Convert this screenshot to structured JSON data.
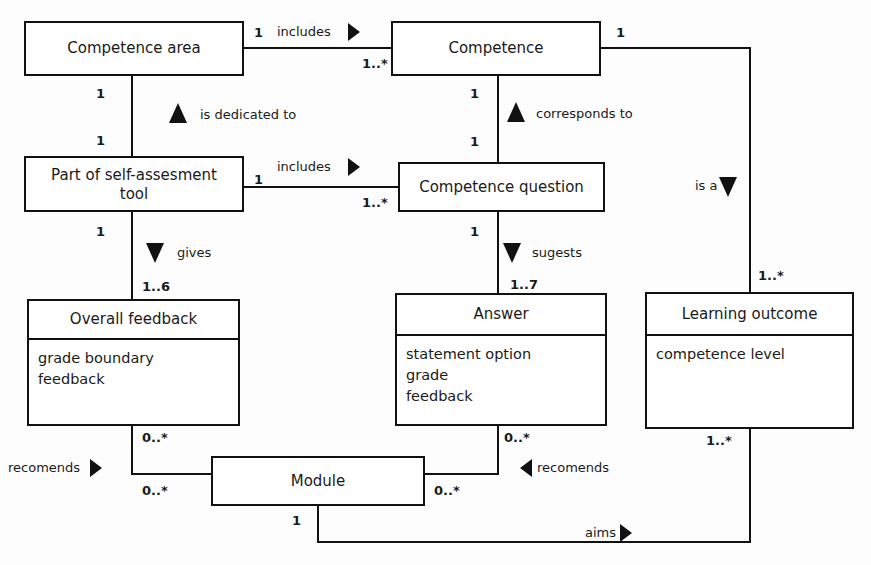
{
  "diagram": {
    "kind": "uml-class-diagram",
    "title": "",
    "colors": {
      "background": "#fdfdfd",
      "box_fill": "#ffffff",
      "stroke": "#111111",
      "text": "#1a1a1a"
    },
    "classes": [
      {
        "id": "competence-area",
        "name": "Competence area",
        "attributes": [],
        "x": 25,
        "y": 22,
        "w": 218,
        "h": 53,
        "title_h": 53
      },
      {
        "id": "competence",
        "name": "Competence",
        "attributes": [],
        "x": 392,
        "y": 22,
        "w": 208,
        "h": 53,
        "title_h": 53
      },
      {
        "id": "part-of-self-assesment-tool",
        "name": "Part of self-assesment tool",
        "attributes": [],
        "x": 25,
        "y": 157,
        "w": 218,
        "h": 54,
        "title_h": 54
      },
      {
        "id": "competence-question",
        "name": "Competence question",
        "attributes": [],
        "x": 399,
        "y": 163,
        "w": 205,
        "h": 48,
        "title_h": 48
      },
      {
        "id": "overall-feedback",
        "name": "Overall feedback",
        "attributes": [
          "grade boundary",
          "feedback"
        ],
        "x": 28,
        "y": 300,
        "w": 211,
        "h": 125,
        "title_h": 39
      },
      {
        "id": "answer",
        "name": "Answer",
        "attributes": [
          "statement option",
          "grade",
          "feedback"
        ],
        "x": 396,
        "y": 294,
        "w": 210,
        "h": 131,
        "title_h": 41
      },
      {
        "id": "learning-outcome",
        "name": "Learning outcome",
        "attributes": [
          "competence level"
        ],
        "x": 646,
        "y": 293,
        "w": 207,
        "h": 135,
        "title_h": 42
      },
      {
        "id": "module",
        "name": "Module",
        "attributes": [],
        "x": 212,
        "y": 457,
        "w": 212,
        "h": 48,
        "title_h": 48
      }
    ],
    "relationships": [
      {
        "id": "competence-area-includes-competence",
        "label": "includes",
        "label_x": 277,
        "label_y": 32,
        "arrow": {
          "dir": "right",
          "x": 348,
          "y": 32
        },
        "source_mult": "1",
        "source_mult_x": 254,
        "source_mult_y": 33,
        "target_mult": "1..*",
        "target_mult_x": 362,
        "target_mult_y": 64,
        "path": "M 243 48 L 392 48"
      },
      {
        "id": "competence-area-is-dedicated-to-part-of-tool",
        "label": "is dedicated to",
        "label_x": 200,
        "label_y": 115,
        "arrow": {
          "dir": "up",
          "x": 178,
          "y": 114
        },
        "source_mult": "1",
        "source_mult_x": 96,
        "source_mult_y": 94,
        "target_mult": "1",
        "target_mult_x": 96,
        "target_mult_y": 141,
        "path": "M 132 75 L 132 157"
      },
      {
        "id": "part-of-tool-includes-competence-question",
        "label": "includes",
        "label_x": 277,
        "label_y": 167,
        "arrow": {
          "dir": "right",
          "x": 348,
          "y": 167
        },
        "source_mult": "1",
        "source_mult_x": 254,
        "source_mult_y": 180,
        "target_mult": "1..*",
        "target_mult_x": 362,
        "target_mult_y": 203,
        "path": "M 243 187 L 399 187"
      },
      {
        "id": "competence-corresponds-to-competence-question",
        "label": "corresponds to",
        "label_x": 536,
        "label_y": 114,
        "arrow": {
          "dir": "up",
          "x": 516,
          "y": 113
        },
        "source_mult": "1",
        "source_mult_x": 470,
        "source_mult_y": 94,
        "target_mult": "1",
        "target_mult_x": 470,
        "target_mult_y": 142,
        "path": "M 498 75 L 498 163"
      },
      {
        "id": "part-of-tool-gives-overall-feedback",
        "label": "gives",
        "label_x": 177,
        "label_y": 253,
        "arrow": {
          "dir": "down",
          "x": 155,
          "y": 252
        },
        "source_mult": "1",
        "source_mult_x": 96,
        "source_mult_y": 232,
        "target_mult": "1..6",
        "target_mult_x": 142,
        "target_mult_y": 287,
        "path": "M 132 211 L 132 300"
      },
      {
        "id": "competence-question-sugests-answer",
        "label": "sugests",
        "label_x": 532,
        "label_y": 253,
        "arrow": {
          "dir": "down",
          "x": 512,
          "y": 252
        },
        "source_mult": "1",
        "source_mult_x": 470,
        "source_mult_y": 232,
        "target_mult": "1..7",
        "target_mult_x": 510,
        "target_mult_y": 285,
        "path": "M 498 211 L 498 294"
      },
      {
        "id": "competence-is-a-learning-outcome",
        "label": "is a",
        "label_x": 695,
        "label_y": 186,
        "arrow": {
          "dir": "down",
          "x": 728,
          "y": 186
        },
        "source_mult": "1",
        "source_mult_x": 616,
        "source_mult_y": 33,
        "target_mult": "1..*",
        "target_mult_x": 758,
        "target_mult_y": 276,
        "path": "M 600 48 L 750 48 L 750 293"
      },
      {
        "id": "overall-feedback-recomends-module",
        "label": "recomends",
        "label_x": 8,
        "label_y": 468,
        "arrow": {
          "dir": "right",
          "x": 90,
          "y": 468
        },
        "source_mult": "0..*",
        "source_mult_x": 142,
        "source_mult_y": 438,
        "target_mult": "0..*",
        "target_mult_x": 142,
        "target_mult_y": 491,
        "path": "M 132 425 L 132 474 L 212 474"
      },
      {
        "id": "answer-recomends-module",
        "label": "recomends",
        "label_x": 537,
        "label_y": 468,
        "arrow": {
          "dir": "left",
          "x": 520,
          "y": 468
        },
        "source_mult": "0..*",
        "source_mult_x": 504,
        "source_mult_y": 438,
        "target_mult": "0..*",
        "target_mult_x": 434,
        "target_mult_y": 491,
        "path": "M 498 425 L 498 474 L 424 474"
      },
      {
        "id": "module-aims-learning-outcome",
        "label": "aims",
        "label_x": 585,
        "label_y": 533,
        "arrow": {
          "dir": "right",
          "x": 620,
          "y": 533
        },
        "source_mult": "1",
        "source_mult_x": 292,
        "source_mult_y": 521,
        "target_mult": "1..*",
        "target_mult_x": 706,
        "target_mult_y": 441,
        "path": "M 318 505 L 318 542 L 750 542 L 750 428"
      }
    ]
  }
}
